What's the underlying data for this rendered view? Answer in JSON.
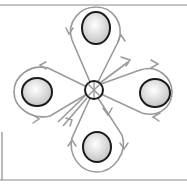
{
  "diagram": {
    "center_node": {
      "x": 94,
      "y": 90,
      "r": 9,
      "symbol": "x-cross"
    },
    "balls": [
      {
        "name": "top",
        "x": 96,
        "y": 28,
        "rx": 14,
        "ry": 16
      },
      {
        "name": "right",
        "x": 155,
        "y": 93,
        "rx": 15,
        "ry": 14
      },
      {
        "name": "bottom",
        "x": 97,
        "y": 147,
        "rx": 14,
        "ry": 15
      },
      {
        "name": "left",
        "x": 37,
        "y": 92,
        "rx": 15,
        "ry": 14
      }
    ],
    "colors": {
      "loop": "#9a9a9a",
      "outline": "#1a1a1a",
      "ball_fill_center": "#ffffff",
      "ball_fill_edge": "#c8c8c8",
      "frame": "#8a8a8a"
    }
  }
}
